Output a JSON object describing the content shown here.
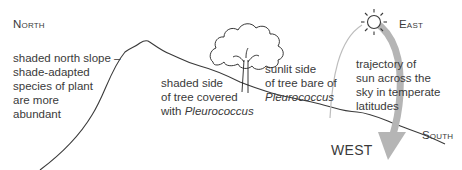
{
  "diagram": {
    "compass": {
      "north": "North",
      "east": "East",
      "south": "South",
      "west": "WEST"
    },
    "labels": {
      "north_slope": [
        "shaded north slope –",
        "shade-adapted",
        "species of plant",
        "are more",
        "abundant"
      ],
      "shaded_side": {
        "line1": "shaded side",
        "line2": "of tree covered",
        "line3_prefix": "with ",
        "line3_italic": "Pleurococcus"
      },
      "sunlit_side": {
        "line1": "sunlit side",
        "line2": "of tree bare of",
        "line3_italic": "Pleurococcus"
      },
      "trajectory": [
        "trajectory of",
        "sun across the",
        "sky in temperate",
        "latitudes"
      ]
    },
    "icons": {
      "sun": "sun-icon",
      "tree": "tree-icon",
      "arrow": "sun-trajectory-arrow"
    },
    "colors": {
      "line": "#3a3a3a",
      "arrow": "#b5b5b5",
      "text": "#3a3a3a"
    }
  }
}
